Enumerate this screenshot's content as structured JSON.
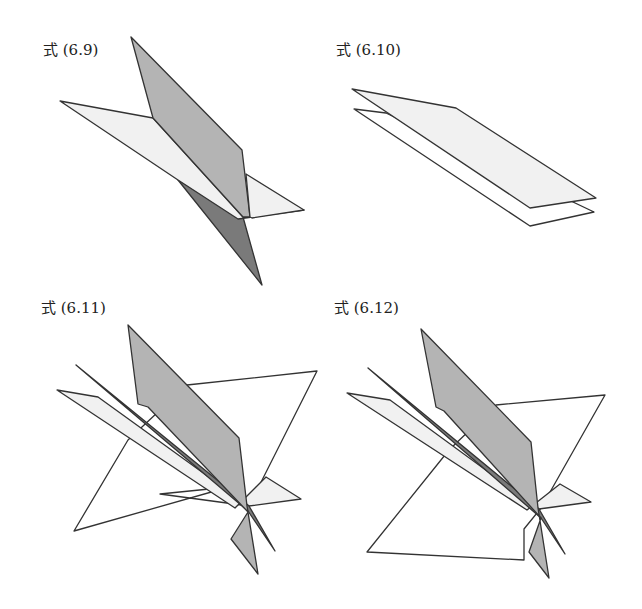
{
  "colors": {
    "stroke": "#333333",
    "light": "#f1f1f1",
    "mid": "#b4b4b4",
    "dark": "#7a7a7a",
    "white": "#ffffff"
  },
  "panels": [
    {
      "id": "6.9",
      "label": "式 (6.9)",
      "label_pos": [
        43,
        55
      ],
      "polygons": [
        {
          "name": "plane-a-back",
          "fill": "dark",
          "points": [
            [
              178,
              180
            ],
            [
              243,
              217
            ],
            [
              262,
              285
            ]
          ]
        },
        {
          "name": "plane-b-light",
          "fill": "light",
          "points": [
            [
              60,
              101
            ],
            [
              153,
              118
            ],
            [
              243,
              217
            ],
            [
              304,
              210
            ],
            [
              238,
              219
            ],
            [
              178,
              180
            ]
          ]
        },
        {
          "name": "plane-a-front",
          "fill": "mid",
          "points": [
            [
              131,
              37
            ],
            [
              242,
              150
            ],
            [
              250,
              217
            ],
            [
              243,
              217
            ],
            [
              153,
              118
            ]
          ]
        },
        {
          "name": "plane-b-right",
          "fill": "light",
          "points": [
            [
              246,
              174
            ],
            [
              304,
              210
            ],
            [
              252,
              218
            ],
            [
              250,
              217
            ]
          ]
        }
      ]
    },
    {
      "id": "6.10",
      "label": "式 (6.10)",
      "label_pos": [
        336,
        55
      ],
      "polygons": [
        {
          "name": "plane-lower",
          "fill": "white",
          "points": [
            [
              354,
              109
            ],
            [
              386,
              113
            ],
            [
              594,
              212
            ],
            [
              530,
              226
            ]
          ]
        },
        {
          "name": "plane-upper",
          "fill": "light",
          "points": [
            [
              352,
              89
            ],
            [
              456,
              108
            ],
            [
              596,
              198
            ],
            [
              530,
              208
            ]
          ]
        }
      ]
    },
    {
      "id": "6.11",
      "label": "式 (6.11)",
      "label_pos": [
        41,
        313
      ],
      "polygons": [
        {
          "name": "plane-white-big",
          "fill": "white",
          "points": [
            [
              187,
              385
            ],
            [
              317,
              371
            ],
            [
              249,
              506
            ],
            [
              160,
              494
            ],
            [
              229,
              487
            ],
            [
              74,
              531
            ],
            [
              128,
              440
            ]
          ]
        },
        {
          "name": "plane-light",
          "fill": "light",
          "points": [
            [
              57,
              390
            ],
            [
              98,
              397
            ],
            [
              249,
              506
            ],
            [
              301,
              499
            ],
            [
              266,
              477
            ],
            [
              235,
              508
            ]
          ]
        },
        {
          "name": "plane-dark",
          "fill": "dark",
          "points": [
            [
              76,
              365
            ],
            [
              249,
              506
            ],
            [
              275,
              551
            ],
            [
              248,
              511
            ]
          ]
        },
        {
          "name": "plane-mid",
          "fill": "mid",
          "points": [
            [
              128,
              325
            ],
            [
              239,
              438
            ],
            [
              247,
              506
            ],
            [
              258,
              574
            ],
            [
              231,
              539
            ],
            [
              248,
              512
            ],
            [
              148,
              407
            ],
            [
              138,
              404
            ]
          ]
        }
      ]
    },
    {
      "id": "6.12",
      "label": "式 (6.12)",
      "label_pos": [
        334,
        313
      ],
      "polygons": [
        {
          "name": "plane-white-big",
          "fill": "white",
          "points": [
            [
              496,
              405
            ],
            [
              605,
              395
            ],
            [
              541,
              508
            ],
            [
              524,
              529
            ],
            [
              524,
              560
            ],
            [
              367,
              552
            ],
            [
              449,
              450
            ]
          ]
        },
        {
          "name": "plane-light",
          "fill": "light",
          "points": [
            [
              347,
              393
            ],
            [
              390,
              400
            ],
            [
              539,
              509
            ],
            [
              591,
              502
            ],
            [
              560,
              484
            ],
            [
              527,
              510
            ]
          ]
        },
        {
          "name": "plane-dark",
          "fill": "dark",
          "points": [
            [
              368,
              368
            ],
            [
              539,
              509
            ],
            [
              565,
              554
            ],
            [
              541,
              518
            ]
          ]
        },
        {
          "name": "plane-mid",
          "fill": "mid",
          "points": [
            [
              421,
              329
            ],
            [
              531,
              442
            ],
            [
              538,
              508
            ],
            [
              549,
              578
            ],
            [
              529,
              552
            ],
            [
              541,
              518
            ],
            [
              444,
              411
            ],
            [
              436,
              407
            ]
          ]
        }
      ]
    }
  ]
}
